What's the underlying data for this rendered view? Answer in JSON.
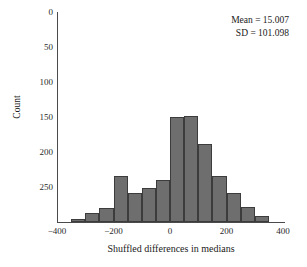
{
  "chart_data": {
    "type": "bar",
    "title": "",
    "subtitle": "",
    "xlabel": "Shuffled differences in medians",
    "ylabel": "Count",
    "grid": false,
    "legend": null,
    "bin_width": 50,
    "xlim": [
      -400,
      400
    ],
    "ylim": [
      0,
      300
    ],
    "y_axis_inverted": true,
    "xticks": [
      -400,
      -200,
      0,
      200,
      400
    ],
    "xtick_labels": [
      "−400",
      "−200",
      "0",
      "200",
      "400"
    ],
    "yticks": [
      0,
      50,
      100,
      150,
      200,
      250
    ],
    "ytick_labels": [
      "0",
      "50",
      "100",
      "150",
      "200",
      "250"
    ],
    "bar_color": "#6e6e6e",
    "bar_edge_color": "#3c3c3c",
    "axis_color": "#4a4a4a",
    "categories": [
      -350,
      -300,
      -250,
      -200,
      -150,
      -100,
      -50,
      0,
      50,
      100,
      150,
      200,
      250,
      300
    ],
    "bin_left_edges": [
      -350,
      -300,
      -250,
      -200,
      -150,
      -100,
      -50,
      0,
      50,
      100,
      150,
      200,
      250,
      300
    ],
    "values": [
      5,
      13,
      20,
      66,
      42,
      48,
      60,
      150,
      152,
      112,
      66,
      42,
      22,
      8
    ]
  },
  "annotation": {
    "mean_line": "Mean = 15.007",
    "sd_line": "SD = 101.098",
    "mean_value": 15.007,
    "sd_value": 101.098
  },
  "axes": {
    "x_title": "Shuffled differences in medians",
    "y_title": "Count"
  }
}
